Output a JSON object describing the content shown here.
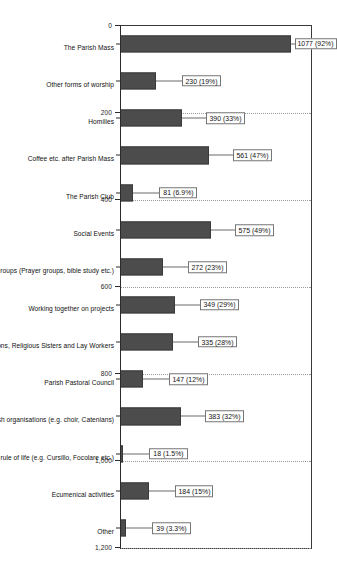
{
  "chart_data": {
    "type": "bar",
    "title": "",
    "xlabel": "",
    "ylabel": "",
    "ylim": [
      0,
      1200
    ],
    "grid": true,
    "legend": "none",
    "orientation": "vertical-rotated-90ccw",
    "bar_color": "#4c4c4c",
    "tick_labels": [
      "0",
      "200",
      "400",
      "600",
      "800",
      "1,000",
      "1,200"
    ],
    "tick_values": [
      0,
      200,
      400,
      600,
      800,
      1000,
      1200
    ],
    "categories": [
      "The Parish Mass",
      "Other forms of worship",
      "Homilies",
      "Coffee etc. after Parish Mass",
      "The Parish Club",
      "Social Events",
      "House Groups (Prayer groups, bible study etc.)",
      "Working together on projects",
      "Ministry of Priests, Deacons, Religious Sisters and Lay Workers",
      "Parish Pastoral Council",
      "Parish organisations (e.g. choir, Catenians)",
      "Groups with a pattern/ rule of life (e.g. Cursillo, Focolare etc.)",
      "Ecumenical activities",
      "Other"
    ],
    "values": [
      1077,
      230,
      390,
      561,
      81,
      575,
      272,
      349,
      335,
      147,
      383,
      18,
      184,
      39
    ],
    "data_labels": [
      "1077 (92%)",
      "230 (19%)",
      "390 (33%)",
      "561 (47%)",
      "81 (6.9%)",
      "575 (49%)",
      "272 (23%)",
      "349 (29%)",
      "335 (28%)",
      "147 (12%)",
      "383 (32%)",
      "18 (1.5%)",
      "184 (15%)",
      "39 (3.3%)"
    ],
    "percentages": [
      92,
      19,
      33,
      47,
      6.9,
      49,
      23,
      29,
      28,
      12,
      32,
      1.5,
      15,
      3.3
    ]
  }
}
